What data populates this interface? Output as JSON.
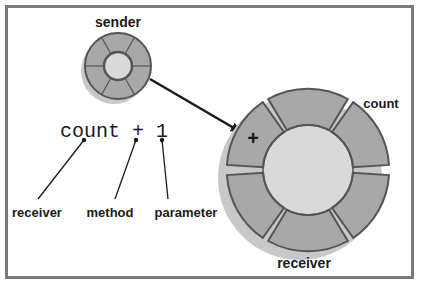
{
  "diagram": {
    "sender": {
      "label": "sender"
    },
    "receiver_object": {
      "label": "receiver",
      "slot_label": "count",
      "method_symbol": "+"
    },
    "expression": {
      "text": "count + 1",
      "parts": [
        {
          "token": "count",
          "role": "receiver"
        },
        {
          "token": "+",
          "role": "method"
        },
        {
          "token": "1",
          "role": "parameter"
        }
      ]
    },
    "annotations": {
      "receiver": "receiver",
      "method": "method",
      "parameter": "parameter"
    },
    "colors": {
      "frame": "#7a7a7a",
      "segment_fill": "#a8a8a8",
      "segment_stroke": "#555555",
      "core_fill": "#d9d9d9",
      "shadow": "#c8c8c8",
      "ink": "#1a1a1a"
    }
  }
}
